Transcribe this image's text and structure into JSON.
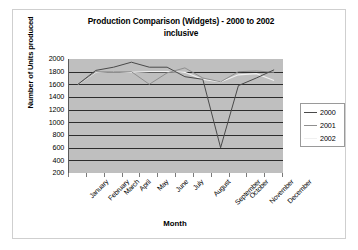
{
  "chart_data": {
    "type": "line",
    "title": "Production Comparison (Widgets) - 2000 to 2002 inclusive",
    "title_line1": "Production Comparison (Widgets) - 2000 to 2002",
    "title_line2": "inclusive",
    "xlabel": "Month",
    "ylabel": "Number of Units produced",
    "categories": [
      "January",
      "February",
      "March",
      "April",
      "May",
      "June",
      "July",
      "August",
      "September",
      "October",
      "November",
      "December"
    ],
    "yticks": [
      2000,
      1800,
      1600,
      1400,
      1200,
      1000,
      800,
      600,
      400,
      200
    ],
    "ylim": [
      200,
      2000
    ],
    "grid": true,
    "legend_position": "right",
    "plot_background": "#bfbfbf",
    "series": [
      {
        "name": "2000",
        "color": "#4a4a4a",
        "values": [
          1600,
          1820,
          1870,
          1950,
          1870,
          1870,
          1720,
          1680,
          600,
          1580,
          1700,
          1830
        ]
      },
      {
        "name": "2001",
        "color": "#8f8f8f",
        "values": [
          1600,
          1800,
          1800,
          1800,
          1600,
          1780,
          1860,
          1700,
          1640,
          1800,
          1810,
          1790
        ]
      },
      {
        "name": "2002",
        "color": "#f0f0f0",
        "values": [
          1600,
          1790,
          1800,
          1790,
          1800,
          1800,
          1790,
          1680,
          1640,
          1750,
          1770,
          1660
        ]
      }
    ]
  },
  "legend": {
    "entries": [
      {
        "label": "2000"
      },
      {
        "label": "2001"
      },
      {
        "label": "2002"
      }
    ]
  }
}
